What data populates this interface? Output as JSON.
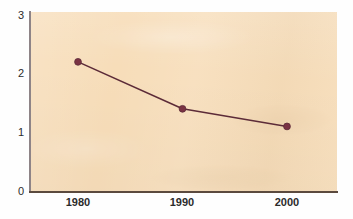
{
  "chart_data": {
    "type": "line",
    "title": "",
    "subtitle": "",
    "xlabel": "",
    "ylabel": "",
    "categories": [
      "1980",
      "1990",
      "2000"
    ],
    "x": [
      1980,
      1990,
      2000
    ],
    "values": [
      2.2,
      1.4,
      1.1
    ],
    "series": [
      {
        "name": "series-1",
        "values": [
          2.2,
          1.4,
          1.1
        ],
        "line_color": "#5c2b38",
        "marker_color": "#7a3243",
        "marker": "circle"
      }
    ],
    "ylim": [
      0,
      3
    ],
    "yticks": [
      0,
      1,
      2,
      3
    ],
    "ytick_labels": [
      "0",
      "1",
      "2",
      "3"
    ],
    "xtick_labels": [
      "1980",
      "1990",
      "2000"
    ],
    "grid": false,
    "legend": null,
    "legend_position": "none",
    "plot_background": "#f7ddb9",
    "figure_background": "#ffffff",
    "axis_color": "#5b4a3e"
  },
  "axes": {
    "y_labels": [
      "3",
      "2",
      "1",
      "0"
    ],
    "x_labels": [
      "1980",
      "1990",
      "2000"
    ]
  }
}
